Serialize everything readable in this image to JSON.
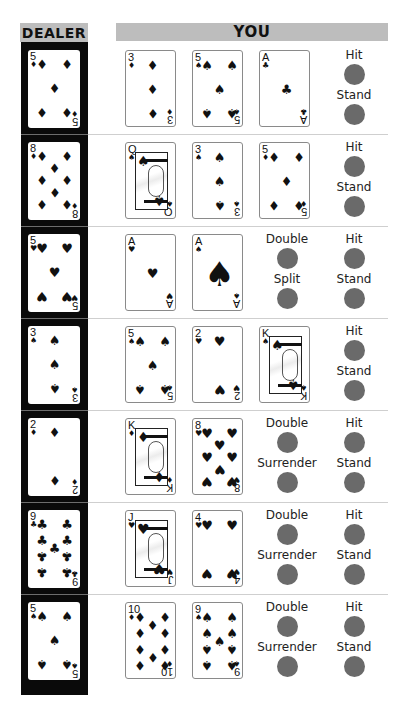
{
  "headers": {
    "dealer": "DEALER",
    "you": "YOU"
  },
  "colors": {
    "header_bg": "#bdbdbd",
    "dealer_bg": "#0a0a0a",
    "button": "#6a6a6a",
    "separator": "#cfcfcf"
  },
  "rows": [
    {
      "dealer": {
        "rank": "5",
        "suit": "diamonds",
        "symbol": "♦"
      },
      "player": [
        {
          "rank": "3",
          "suit": "diamonds",
          "symbol": "♦"
        },
        {
          "rank": "5",
          "suit": "spades",
          "symbol": "♠"
        },
        {
          "rank": "A",
          "suit": "clubs",
          "symbol": "♣"
        }
      ],
      "actions": {
        "left": [],
        "right": [
          "Hit",
          "Stand"
        ]
      }
    },
    {
      "dealer": {
        "rank": "8",
        "suit": "diamonds",
        "symbol": "♦"
      },
      "player": [
        {
          "rank": "Q",
          "suit": "spades",
          "symbol": "♠"
        },
        {
          "rank": "3",
          "suit": "spades",
          "symbol": "♠"
        },
        {
          "rank": "5",
          "suit": "diamonds",
          "symbol": "♦"
        }
      ],
      "actions": {
        "left": [],
        "right": [
          "Hit",
          "Stand"
        ]
      }
    },
    {
      "dealer": {
        "rank": "5",
        "suit": "hearts",
        "symbol": "♥"
      },
      "player": [
        {
          "rank": "A",
          "suit": "hearts",
          "symbol": "♥"
        },
        {
          "rank": "A",
          "suit": "spades",
          "symbol": "♠"
        }
      ],
      "actions": {
        "left": [
          "Double",
          "Split"
        ],
        "right": [
          "Hit",
          "Stand"
        ]
      }
    },
    {
      "dealer": {
        "rank": "3",
        "suit": "spades",
        "symbol": "♠"
      },
      "player": [
        {
          "rank": "5",
          "suit": "spades",
          "symbol": "♠"
        },
        {
          "rank": "2",
          "suit": "hearts",
          "symbol": "♥"
        },
        {
          "rank": "K",
          "suit": "spades",
          "symbol": "♠"
        }
      ],
      "actions": {
        "left": [],
        "right": [
          "Hit",
          "Stand"
        ]
      }
    },
    {
      "dealer": {
        "rank": "2",
        "suit": "diamonds",
        "symbol": "♦"
      },
      "player": [
        {
          "rank": "K",
          "suit": "diamonds",
          "symbol": "♦"
        },
        {
          "rank": "8",
          "suit": "hearts",
          "symbol": "♥"
        }
      ],
      "actions": {
        "left": [
          "Double",
          "Surrender"
        ],
        "right": [
          "Hit",
          "Stand"
        ]
      }
    },
    {
      "dealer": {
        "rank": "9",
        "suit": "clubs",
        "symbol": "♣"
      },
      "player": [
        {
          "rank": "J",
          "suit": "hearts",
          "symbol": "♥"
        },
        {
          "rank": "4",
          "suit": "hearts",
          "symbol": "♥"
        }
      ],
      "actions": {
        "left": [
          "Double",
          "Surrender"
        ],
        "right": [
          "Hit",
          "Stand"
        ]
      }
    },
    {
      "dealer": {
        "rank": "5",
        "suit": "spades",
        "symbol": "♠"
      },
      "player": [
        {
          "rank": "10",
          "suit": "diamonds",
          "symbol": "♦"
        },
        {
          "rank": "9",
          "suit": "spades",
          "symbol": "♠"
        }
      ],
      "actions": {
        "left": [
          "Double",
          "Surrender"
        ],
        "right": [
          "Hit",
          "Stand"
        ]
      }
    }
  ]
}
